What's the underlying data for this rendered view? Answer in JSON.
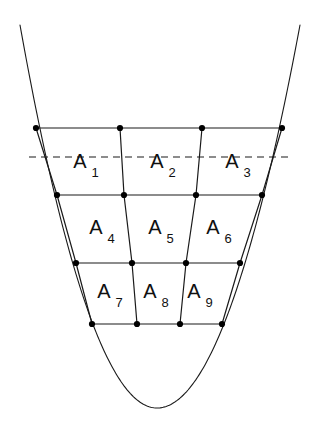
{
  "figure": {
    "background_color": "#ffffff",
    "stroke_color": "#1a1a1a",
    "node_color": "#000000",
    "curve_stroke_width": 1.1,
    "grid_stroke_width": 1.2,
    "dashed_stroke_width": 1.2,
    "node_radius": 3.1
  },
  "chart_data": {
    "type": "diagram",
    "xlabel": "",
    "ylabel": "",
    "grid": false,
    "legend": "none",
    "xlim": [
      0,
      313
    ],
    "ylim": [
      0,
      431
    ],
    "curve": {
      "name": "parabola",
      "vertex": [
        157,
        408
      ],
      "left_endpoint": [
        20,
        25
      ],
      "right_endpoint": [
        300,
        25
      ],
      "style": "solid"
    },
    "dashed_line": {
      "name": "chord",
      "y": 157,
      "x_start": 29,
      "x_end": 292,
      "style": "dashed"
    },
    "horizontal_lines": [
      {
        "row": 1,
        "y": 128,
        "x_start": 36,
        "x_end": 282
      },
      {
        "row": 2,
        "y": 195,
        "x_start": 57,
        "x_end": 262
      },
      {
        "row": 3,
        "y": 263,
        "x_start": 76,
        "x_end": 240
      },
      {
        "row": 4,
        "y": 324,
        "x_start": 92,
        "x_end": 222
      }
    ],
    "slanted_lines": [
      {
        "col": 0,
        "points": [
          [
            36,
            128
          ],
          [
            57,
            195
          ],
          [
            76,
            263
          ],
          [
            92,
            324
          ]
        ]
      },
      {
        "col": 1,
        "points": [
          [
            120,
            128
          ],
          [
            124,
            195
          ],
          [
            132,
            263
          ],
          [
            137,
            324
          ]
        ]
      },
      {
        "col": 2,
        "points": [
          [
            202,
            128
          ],
          [
            196,
            195
          ],
          [
            186,
            263
          ],
          [
            180,
            324
          ]
        ]
      },
      {
        "col": 3,
        "points": [
          [
            282,
            128
          ],
          [
            262,
            195
          ],
          [
            240,
            263
          ],
          [
            222,
            324
          ]
        ]
      }
    ],
    "nodes": [
      {
        "x": 36,
        "y": 128
      },
      {
        "x": 120,
        "y": 128
      },
      {
        "x": 202,
        "y": 128
      },
      {
        "x": 282,
        "y": 128
      },
      {
        "x": 57,
        "y": 195
      },
      {
        "x": 124,
        "y": 195
      },
      {
        "x": 196,
        "y": 195
      },
      {
        "x": 262,
        "y": 195
      },
      {
        "x": 76,
        "y": 263
      },
      {
        "x": 132,
        "y": 263
      },
      {
        "x": 186,
        "y": 263
      },
      {
        "x": 240,
        "y": 263
      },
      {
        "x": 92,
        "y": 324
      },
      {
        "x": 137,
        "y": 324
      },
      {
        "x": 180,
        "y": 324
      },
      {
        "x": 222,
        "y": 324
      }
    ],
    "cells": [
      {
        "id": "A1",
        "base": "A",
        "subscript": "1",
        "row": 1,
        "col": 1,
        "label_x": 80,
        "label_y": 168,
        "sub_x": 95,
        "sub_y": 177
      },
      {
        "id": "A2",
        "base": "A",
        "subscript": "2",
        "row": 1,
        "col": 2,
        "label_x": 157,
        "label_y": 168,
        "sub_x": 172,
        "sub_y": 177
      },
      {
        "id": "A3",
        "base": "A",
        "subscript": "3",
        "row": 1,
        "col": 3,
        "label_x": 232,
        "label_y": 168,
        "sub_x": 247,
        "sub_y": 177
      },
      {
        "id": "A4",
        "base": "A",
        "subscript": "4",
        "row": 2,
        "col": 1,
        "label_x": 96,
        "label_y": 234,
        "sub_x": 111,
        "sub_y": 243
      },
      {
        "id": "A5",
        "base": "A",
        "subscript": "5",
        "row": 2,
        "col": 2,
        "label_x": 155,
        "label_y": 234,
        "sub_x": 170,
        "sub_y": 243
      },
      {
        "id": "A6",
        "base": "A",
        "subscript": "6",
        "row": 2,
        "col": 3,
        "label_x": 213,
        "label_y": 234,
        "sub_x": 228,
        "sub_y": 243
      },
      {
        "id": "A7",
        "base": "A",
        "subscript": "7",
        "row": 3,
        "col": 1,
        "label_x": 104,
        "label_y": 298,
        "sub_x": 119,
        "sub_y": 307
      },
      {
        "id": "A8",
        "base": "A",
        "subscript": "8",
        "row": 3,
        "col": 2,
        "label_x": 150,
        "label_y": 298,
        "sub_x": 165,
        "sub_y": 307
      },
      {
        "id": "A9",
        "base": "A",
        "subscript": "9",
        "row": 3,
        "col": 3,
        "label_x": 194,
        "label_y": 298,
        "sub_x": 209,
        "sub_y": 307
      }
    ]
  }
}
